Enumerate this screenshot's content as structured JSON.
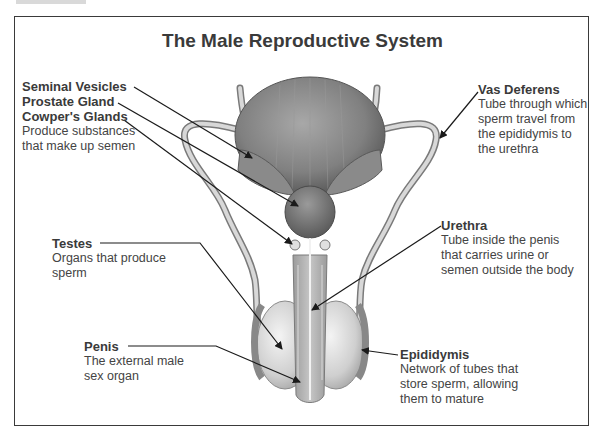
{
  "title": "The Male Reproductive System",
  "colors": {
    "frame": "#3a3a3a",
    "text": "#3a3a3a",
    "organ_dark": "#6e6e6e",
    "organ_mid": "#9a9a9a",
    "organ_light": "#d4d4d4",
    "leader_line": "#1a1a1a"
  },
  "labels": {
    "seminal_vesicles": {
      "name": "Seminal Vesicles"
    },
    "prostate_gland": {
      "name": "Prostate Gland"
    },
    "cowpers_glands": {
      "name": "Cowper's Glands",
      "desc_lines": [
        "Produce substances",
        "that make up semen"
      ]
    },
    "vas_deferens": {
      "name": "Vas Deferens",
      "desc_lines": [
        "Tube through which",
        "sperm travel from",
        "the epididymis to",
        "the urethra"
      ]
    },
    "urethra": {
      "name": "Urethra",
      "desc_lines": [
        "Tube inside the penis",
        "that carries urine or",
        "semen outside the body"
      ]
    },
    "testes": {
      "name": "Testes",
      "desc_lines": [
        "Organs that produce",
        "sperm"
      ]
    },
    "penis": {
      "name": "Penis",
      "desc_lines": [
        "The external male",
        "sex organ"
      ]
    },
    "epididymis": {
      "name": "Epididymis",
      "desc_lines": [
        "Network of tubes that",
        "store sperm, allowing",
        "them to mature"
      ]
    }
  }
}
